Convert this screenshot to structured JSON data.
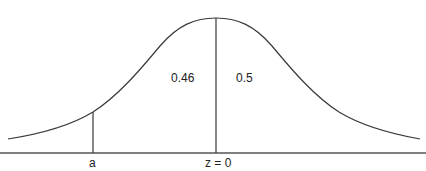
{
  "diagram": {
    "type": "normal-distribution-curve",
    "labels": {
      "left_area": "0.46",
      "right_area": "0.5",
      "a_marker": "a",
      "center_marker": "z = 0"
    },
    "colors": {
      "line": "#3a3a3a",
      "axis": "#555555",
      "text": "#222222"
    }
  }
}
